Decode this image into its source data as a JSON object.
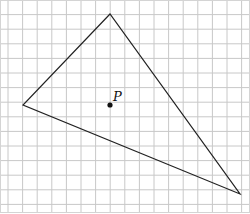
{
  "diagram": {
    "type": "grid-triangle",
    "grid": {
      "cols": 17,
      "rows": 14,
      "spacing_px": 14.6,
      "origin": [
        8,
        0
      ],
      "line_color": "#c8c8c8"
    },
    "triangle": {
      "vertices": [
        [
          110,
          14
        ],
        [
          23,
          105
        ],
        [
          240,
          194
        ]
      ],
      "stroke": "#222222"
    },
    "point": {
      "label": "P",
      "x": 110,
      "y": 105
    }
  }
}
